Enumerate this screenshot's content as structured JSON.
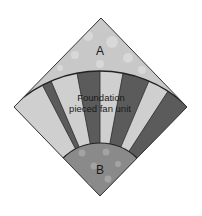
{
  "figure": {
    "caption_top": "",
    "region_a_label": "A",
    "region_b_label": "B",
    "fan_label_line1": "Foundation",
    "fan_label_line2": "pieced fan unit",
    "stripe_count": 8,
    "stripe_pattern": [
      "light",
      "dark",
      "light",
      "dark",
      "light",
      "dark",
      "light",
      "dark"
    ],
    "colors": {
      "region_a": "#c9c9c9",
      "region_a_spots": "#dcdcdc",
      "stripe_light": "#cfcfcf",
      "stripe_dark": "#5b5b5b",
      "region_b": "#8a8a8a",
      "region_b_spots": "#a6a6a6",
      "outline": "#222222"
    }
  }
}
